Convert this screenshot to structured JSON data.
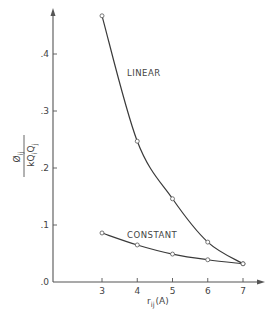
{
  "chart_data": {
    "type": "line",
    "title": "",
    "xlabel": "r_ij (A)",
    "xlabel_main": "r",
    "xlabel_sub": "ij",
    "xlabel_unit": "(A)",
    "ylabel": "Øij / kQiQj",
    "ylabel_numerator": "Ø",
    "ylabel_numerator_sub": "ij",
    "ylabel_denominator": "kQ",
    "ylabel_denominator_sub1": "i",
    "ylabel_denominator_mid": "Q",
    "ylabel_denominator_sub2": "j",
    "x": [
      3,
      4,
      5,
      6,
      7
    ],
    "xlim": [
      2.5,
      7.6
    ],
    "ylim": [
      0.0,
      0.5
    ],
    "x_ticks": [
      3,
      4,
      5,
      6,
      7
    ],
    "x_tick_labels": [
      "3",
      "4",
      "5",
      "6",
      "7"
    ],
    "y_ticks": [
      0.0,
      0.1,
      0.2,
      0.3,
      0.4
    ],
    "y_tick_labels": [
      ".0",
      ".1",
      ".2",
      ".3",
      ".4"
    ],
    "grid": false,
    "legend": "inline labels",
    "series": [
      {
        "name": "LINEAR",
        "values": [
          0.467,
          0.247,
          0.146,
          0.07,
          0.032
        ],
        "marker": "open-circle"
      },
      {
        "name": "CONSTANT",
        "values": [
          0.086,
          0.065,
          0.049,
          0.039,
          0.032
        ],
        "marker": "open-circle"
      }
    ]
  },
  "colors": {
    "ink": "#3a3a3a",
    "axis": "#555555",
    "background": "#ffffff"
  }
}
